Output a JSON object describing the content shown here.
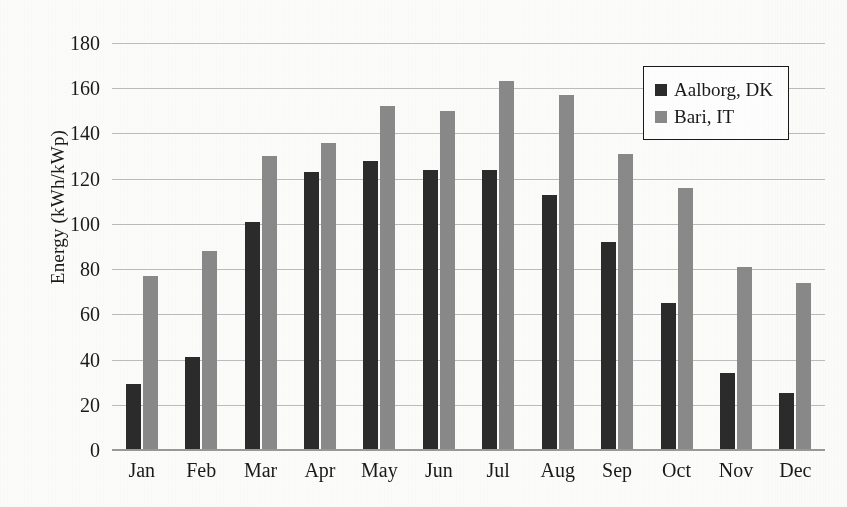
{
  "chart_data": {
    "type": "bar",
    "title": "",
    "xlabel": "",
    "ylabel": "Energy (kWh/kWp)",
    "categories": [
      "Jan",
      "Feb",
      "Mar",
      "Apr",
      "May",
      "Jun",
      "Jul",
      "Aug",
      "Sep",
      "Oct",
      "Nov",
      "Dec"
    ],
    "series": [
      {
        "name": "Aalborg, DK",
        "color": "#2b2b2b",
        "values": [
          29,
          41,
          101,
          123,
          128,
          124,
          124,
          113,
          92,
          65,
          34,
          25
        ]
      },
      {
        "name": "Bari, IT",
        "color": "#8a8a8a",
        "values": [
          77,
          88,
          130,
          136,
          152,
          150,
          163,
          157,
          131,
          116,
          81,
          74
        ]
      }
    ],
    "ylim": [
      0,
      180
    ],
    "yticks": [
      0,
      20,
      40,
      60,
      80,
      100,
      120,
      140,
      160,
      180
    ],
    "ytick_labels": [
      "0",
      "20",
      "40",
      "60",
      "80",
      "100",
      "120",
      "140",
      "160",
      "180"
    ],
    "grid": true,
    "legend_position": "top-right"
  },
  "legend": {
    "entries": [
      {
        "label": "Aalborg, DK",
        "swatch": "dark-square-swatch"
      },
      {
        "label": "Bari, IT",
        "swatch": "gray-square-swatch"
      }
    ]
  },
  "colors": {
    "series_dark": "#2b2b2b",
    "series_gray": "#8a8a8a",
    "gridline": "#bdbdbd",
    "axis": "#9a9a9a",
    "text": "#1a1a1a",
    "background": "#fdfdfc"
  }
}
